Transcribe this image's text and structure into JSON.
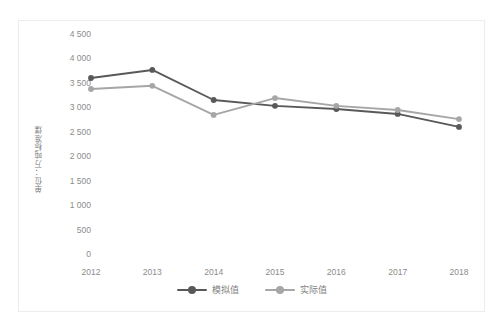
{
  "chart_data": {
    "type": "line",
    "title": "",
    "subtitle": "",
    "xlabel": "",
    "ylabel": "单位：万吨标准煤",
    "categories": [
      "2012",
      "2013",
      "2014",
      "2015",
      "2016",
      "2017",
      "2018"
    ],
    "x": [
      2012,
      2013,
      2014,
      2015,
      2016,
      2017,
      2018
    ],
    "series": [
      {
        "name": "模拟值",
        "color": "#595959",
        "values": [
          3600,
          3765,
          3150,
          3030,
          2965,
          2865,
          2600
        ]
      },
      {
        "name": "实际值",
        "color": "#a6a6a6",
        "values": [
          3375,
          3440,
          2845,
          3190,
          3030,
          2945,
          2760
        ]
      }
    ],
    "ylim": [
      0,
      4500
    ],
    "ytick_values": [
      0,
      500,
      1000,
      1500,
      2000,
      2500,
      3000,
      3500,
      4000,
      4500
    ],
    "ytick_labels": [
      "0",
      "500",
      "1 000",
      "1 500",
      "2 000",
      "2 500",
      "3 000",
      "3 500",
      "4 000",
      "4 500"
    ],
    "grid": false,
    "legend_position": "bottom",
    "marker": "circle",
    "border_color": "#ececec",
    "axis_text_color": "#8c8c8c",
    "background_color": "#ffffff"
  },
  "legend": {
    "items": [
      {
        "label": "模拟值",
        "color": "#595959"
      },
      {
        "label": "实际值",
        "color": "#a6a6a6"
      }
    ]
  }
}
